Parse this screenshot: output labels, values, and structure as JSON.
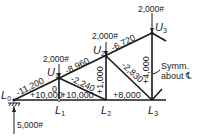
{
  "diagram": {
    "type": "truss",
    "nodes": {
      "L0": {
        "label": "L",
        "sub": "0"
      },
      "L1": {
        "label": "L",
        "sub": "1"
      },
      "L2": {
        "label": "L",
        "sub": "2"
      },
      "L3": {
        "label": "L",
        "sub": "3"
      },
      "U1": {
        "label": "U",
        "sub": "1"
      },
      "U2": {
        "label": "U",
        "sub": "2"
      },
      "U3": {
        "label": "U",
        "sub": "3"
      }
    },
    "loads": {
      "U1": "2,000#",
      "U2": "2,000#",
      "U3": "2,000#",
      "reaction_L0": "5,000#"
    },
    "members": {
      "L0U1": "-11,200",
      "U1U2": "-8,960",
      "U2U3": "-6,720",
      "L0L1": "+10,000",
      "L1L2": "+10,000",
      "L2L3": "+8,000",
      "U1L1": "0",
      "U1L2": "-2,240",
      "U2L2": "+1,000",
      "U2L3": "-2,830",
      "U3L3": "+4,000"
    },
    "note": {
      "line1": "Symm.",
      "line2": "about ℄"
    }
  }
}
